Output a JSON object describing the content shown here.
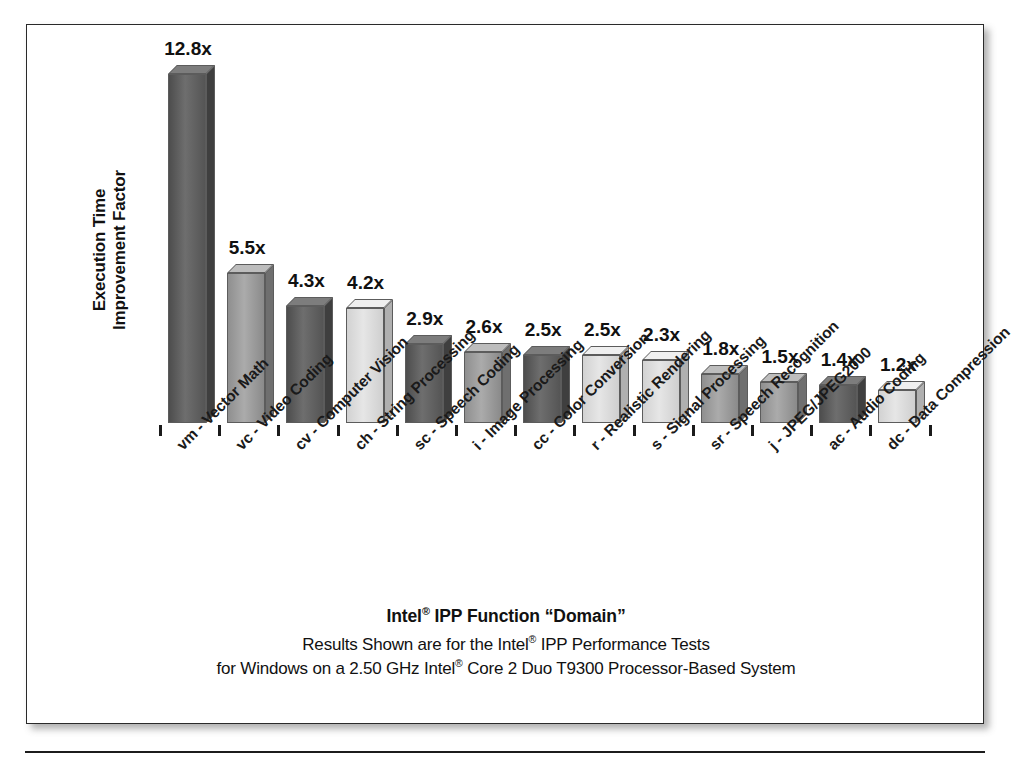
{
  "chart_data": {
    "type": "bar",
    "xlabel": "Intel® IPP Function \"Domain\"",
    "ylabel": "Execution Time Improvement Factor",
    "ylim": [
      0,
      13.5
    ],
    "grid": false,
    "legend": "none",
    "value_suffix": "x",
    "categories": [
      "vm - Vector Math",
      "vc - Video Coding",
      "cv - Computer Vision",
      "ch - String Processing",
      "sc - Speech Coding",
      "i - Image Processing",
      "cc - Color Conversion",
      "r - Realistic Rendering",
      "s - Signal Processing",
      "sr - Speech Recognition",
      "j - JPEG/JPEG2000",
      "ac - Audio Coding",
      "dc - Data Compression"
    ],
    "values": [
      12.8,
      5.5,
      4.3,
      4.2,
      2.9,
      2.6,
      2.5,
      2.5,
      2.3,
      1.8,
      1.5,
      1.4,
      1.2
    ],
    "value_labels": [
      "12.8x",
      "5.5x",
      "4.3x",
      "4.2x",
      "2.9x",
      "2.6x",
      "2.5x",
      "2.5x",
      "2.3x",
      "1.8x",
      "1.5x",
      "1.4x",
      "1.2x"
    ],
    "bar_shades": [
      "dark",
      "mid",
      "dark",
      "light",
      "dark",
      "mid",
      "dark",
      "light",
      "light",
      "mid",
      "mid",
      "dark",
      "light"
    ]
  },
  "axis": {
    "y_title_line1": "Execution Time",
    "y_title_line2": "Improvement Factor"
  },
  "caption": {
    "title_pre": "Intel",
    "title_sup": "®",
    "title_post": " IPP Function “Domain”",
    "line2_a": "Results Shown are for the Intel",
    "line2_sup": "®",
    "line2_b": " IPP Performance Tests",
    "line3_a": "for Windows on a 2.50 GHz Intel",
    "line3_sup": "®",
    "line3_b": " Core 2 Duo T9300 Processor-Based System"
  },
  "colors": {
    "frame_border": "#2a2a2a",
    "text": "#111111",
    "bar_dark": "#5e5e5e",
    "bar_mid": "#a0a0a0",
    "bar_light": "#dcdcdc"
  }
}
